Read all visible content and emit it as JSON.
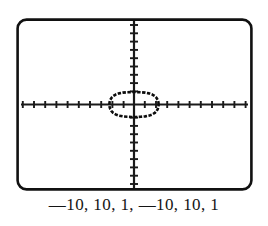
{
  "figure": {
    "name": "graphing-calculator-screen",
    "caption": "—10, 10, 1, —10, 10, 1",
    "frame_color": "#111111",
    "screen_background": "#ffffff",
    "curve_color": "#0d0d0d",
    "axis_color": "#1a1a1a"
  },
  "chart_data": {
    "type": "line",
    "title": "",
    "subtitle": "",
    "xlabel": "",
    "ylabel": "",
    "grid": false,
    "legend": null,
    "window_settings": {
      "xmin": -10,
      "xmax": 10,
      "xscl": 1,
      "ymin": -10,
      "ymax": 10,
      "yscl": 1
    },
    "xlim": [
      -10,
      10
    ],
    "ylim": [
      -10,
      10
    ],
    "xticks": [
      -9,
      -8,
      -7,
      -6,
      -5,
      -4,
      -3,
      -2,
      -1,
      1,
      2,
      3,
      4,
      5,
      6,
      7,
      8,
      9
    ],
    "yticks": [
      -9,
      -8,
      -7,
      -6,
      -5,
      -4,
      -3,
      -2,
      -1,
      1,
      2,
      3,
      4,
      5,
      6,
      7,
      8,
      9
    ],
    "tick_labels_shown": false,
    "series": [
      {
        "name": "closed-curve",
        "closed": true,
        "shape": "superellipse",
        "x_semi_axis": 2.2,
        "y_semi_axis": 1.5,
        "exponent": 2.8,
        "center": [
          0,
          0
        ],
        "x": [
          2.2,
          2.18,
          2.12,
          2.01,
          1.85,
          1.63,
          1.35,
          1.0,
          0.6,
          0.2,
          -0.2,
          -0.6,
          -1.0,
          -1.35,
          -1.63,
          -1.85,
          -2.01,
          -2.12,
          -2.18,
          -2.2,
          -2.18,
          -2.12,
          -2.01,
          -1.85,
          -1.63,
          -1.35,
          -1.0,
          -0.6,
          -0.2,
          0.2,
          0.6,
          1.0,
          1.35,
          1.63,
          1.85,
          2.01,
          2.12,
          2.18,
          2.2
        ],
        "y": [
          0.0,
          0.28,
          0.55,
          0.8,
          1.02,
          1.2,
          1.34,
          1.43,
          1.48,
          1.5,
          1.5,
          1.48,
          1.43,
          1.34,
          1.2,
          1.02,
          0.8,
          0.55,
          0.28,
          0.0,
          -0.28,
          -0.55,
          -0.8,
          -1.02,
          -1.2,
          -1.34,
          -1.43,
          -1.48,
          -1.5,
          -1.5,
          -1.48,
          -1.43,
          -1.34,
          -1.2,
          -1.02,
          -0.8,
          -0.55,
          -0.28,
          0.0
        ]
      }
    ]
  }
}
